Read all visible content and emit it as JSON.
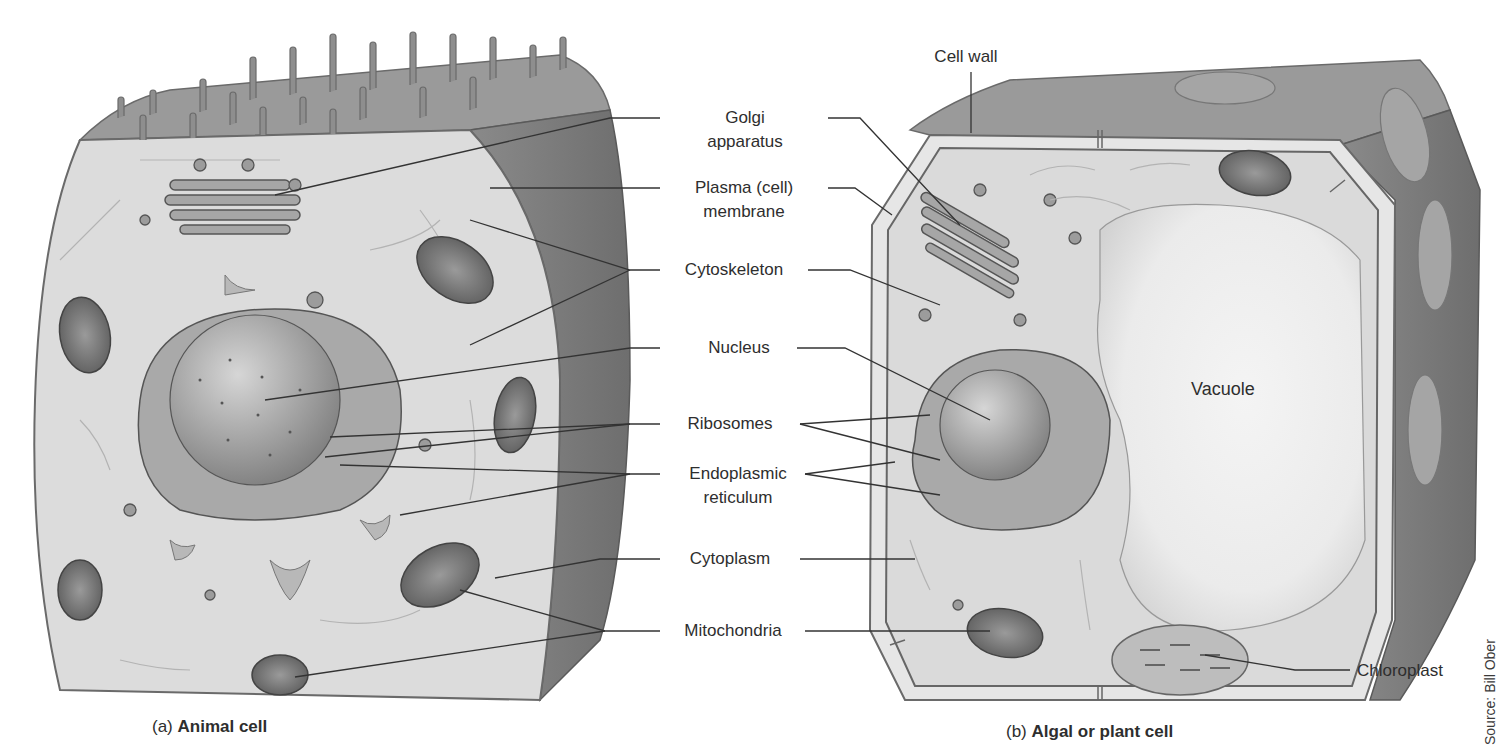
{
  "figure": {
    "panels": [
      {
        "id": "a",
        "prefix": "(a)",
        "title": "Animal cell"
      },
      {
        "id": "b",
        "prefix": "(b)",
        "title": "Algal or plant cell"
      }
    ],
    "labels": {
      "cell_wall": "Cell wall",
      "golgi_1": "Golgi",
      "golgi_2": "apparatus",
      "plasma_1": "Plasma (cell)",
      "plasma_2": "membrane",
      "cytoskeleton": "Cytoskeleton",
      "nucleus": "Nucleus",
      "ribosomes": "Ribosomes",
      "er_1": "Endoplasmic",
      "er_2": "reticulum",
      "cytoplasm": "Cytoplasm",
      "mitochondria": "Mitochondria",
      "vacuole": "Vacuole",
      "chloroplast": "Chloroplast"
    },
    "source": "Source: Bill Ober",
    "colors": {
      "background": "#ffffff",
      "cytoplasm": "#dcdcdc",
      "membrane_dark": "#8a8a8a",
      "side_face": "#7b7b7b",
      "top_face": "#9a9a9a",
      "vacuole": "#eeeeee",
      "organelle": "#a8a8a8",
      "leader_line": "#333333",
      "text": "#2e2e2e"
    }
  }
}
